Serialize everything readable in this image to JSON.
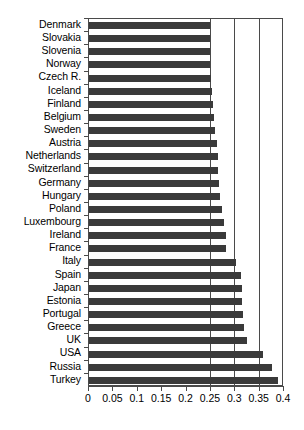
{
  "chart_data": {
    "type": "bar",
    "orientation": "horizontal",
    "title": "",
    "subtitle": "",
    "xlabel": "",
    "ylabel": "",
    "xlim": [
      0,
      0.4
    ],
    "ylim": null,
    "grid": true,
    "gridlines_x": [
      0.25,
      0.3,
      0.35
    ],
    "legend": null,
    "legend_position": "none",
    "bar_color": "#3a3a3a",
    "axis_color": "#4a4a4a",
    "background": "#ffffff",
    "xticks": [
      0,
      0.05,
      0.1,
      0.15,
      0.2,
      0.25,
      0.3,
      0.35,
      0.4
    ],
    "xtick_labels": [
      "0",
      "0.05",
      "0.1",
      "0.15",
      "0.2",
      "0.25",
      "0.3",
      "0.35",
      "0.4"
    ],
    "categories": [
      "Denmark",
      "Slovakia",
      "Slovenia",
      "Norway",
      "Czech R.",
      "Iceland",
      "Finland",
      "Belgium",
      "Sweden",
      "Austria",
      "Netherlands",
      "Switzerland",
      "Germany",
      "Hungary",
      "Poland",
      "Luxembourg",
      "Ireland",
      "France",
      "Italy",
      "Spain",
      "Japan",
      "Estonia",
      "Portugal",
      "Greece",
      "UK",
      "USA",
      "Russia",
      "Turkey"
    ],
    "values": [
      0.248,
      0.248,
      0.249,
      0.249,
      0.251,
      0.252,
      0.254,
      0.257,
      0.258,
      0.262,
      0.264,
      0.265,
      0.267,
      0.269,
      0.272,
      0.277,
      0.28,
      0.282,
      0.302,
      0.311,
      0.313,
      0.314,
      0.316,
      0.318,
      0.325,
      0.357,
      0.376,
      0.387
    ],
    "series": [
      {
        "name": "value",
        "values": [
          0.248,
          0.248,
          0.249,
          0.249,
          0.251,
          0.252,
          0.254,
          0.257,
          0.258,
          0.262,
          0.264,
          0.265,
          0.267,
          0.269,
          0.272,
          0.277,
          0.28,
          0.282,
          0.302,
          0.311,
          0.313,
          0.314,
          0.316,
          0.318,
          0.325,
          0.357,
          0.376,
          0.387
        ]
      }
    ],
    "annotations": []
  }
}
